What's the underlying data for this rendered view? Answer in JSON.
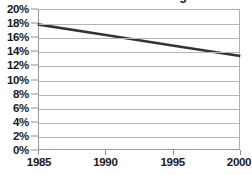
{
  "chart_data": {
    "type": "line",
    "title": "Percent of Labor Force Organized",
    "xlabel": "",
    "ylabel": "",
    "x": [
      1985,
      1990,
      1995,
      2000
    ],
    "series": [
      {
        "name": "Percent of Labor Force Organized",
        "values": [
          17.9,
          16.4,
          14.9,
          13.4
        ],
        "color": "#333333"
      }
    ],
    "xlim": [
      1985,
      2000
    ],
    "ylim": [
      0,
      20
    ],
    "xticks": [
      1985,
      1990,
      1995,
      2000
    ],
    "xtick_labels": [
      "1985",
      "1990",
      "1995",
      "2000"
    ],
    "yticks": [
      0,
      2,
      4,
      6,
      8,
      10,
      12,
      14,
      16,
      18,
      20
    ],
    "ytick_labels": [
      "0%",
      "2%",
      "4%",
      "6%",
      "8%",
      "10%",
      "12%",
      "14%",
      "16%",
      "18%",
      "20%"
    ],
    "grid": "horizontal",
    "legend": "none",
    "colors": {
      "line": "#333333",
      "gridline": "#b5b5b5",
      "axis": "#8f8f8f",
      "background": "#ffffff",
      "text": "#1a1a1a"
    }
  }
}
